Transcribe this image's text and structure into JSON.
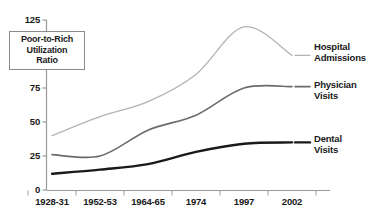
{
  "chart_data": {
    "type": "line",
    "title": "",
    "subtitle": "",
    "xlabel": "",
    "ylabel": "Poor-to-Rich Utilization Ratio",
    "ylabel_lines": [
      "Poor-to-Rich",
      "Utilization",
      "Ratio"
    ],
    "categories": [
      "1928-31",
      "1952-53",
      "1964-65",
      "1974",
      "1997",
      "2002"
    ],
    "yticks": [
      0,
      25,
      50,
      75,
      125
    ],
    "ytick_labels": [
      "0",
      "25",
      "50",
      "75",
      "125"
    ],
    "ylim": [
      0,
      125
    ],
    "grid": false,
    "legend_position": "right-inline",
    "series": [
      {
        "name": "Hospital Admissions",
        "label_lines": [
          "Hospital",
          "Admissions"
        ],
        "color": "#b3b3b3",
        "values": [
          40,
          54,
          65,
          85,
          120,
          99
        ]
      },
      {
        "name": "Physician Visits",
        "label_lines": [
          "Physician",
          "Visits"
        ],
        "color": "#6b6b6b",
        "values": [
          26,
          25,
          44,
          55,
          75,
          76
        ]
      },
      {
        "name": "Dental Visits",
        "label_lines": [
          "Dental",
          "Visits"
        ],
        "color": "#1a1a1a",
        "values": [
          12,
          15,
          19,
          28,
          34,
          35
        ]
      }
    ]
  },
  "axis": {
    "y_title_line1": "Poor-to-Rich",
    "y_title_line2": "Utilization",
    "y_title_line3": "Ratio",
    "ytick_0": "0",
    "ytick_25": "25",
    "ytick_50": "50",
    "ytick_75": "75",
    "ytick_125": "125",
    "xtick_0": "1928-31",
    "xtick_1": "1952-53",
    "xtick_2": "1964-65",
    "xtick_3": "1974",
    "xtick_4": "1997",
    "xtick_5": "2002"
  },
  "legend": {
    "hospital_l1": "Hospital",
    "hospital_l2": "Admissions",
    "physician_l1": "Physician",
    "physician_l2": "Visits",
    "dental_l1": "Dental",
    "dental_l2": "Visits"
  }
}
